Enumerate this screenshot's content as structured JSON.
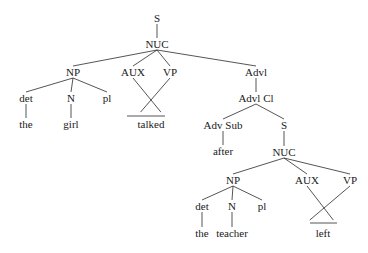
{
  "diagram": {
    "type": "syntax-tree",
    "nodes": [
      {
        "id": "S1",
        "label": "S",
        "x": 157,
        "y": 18
      },
      {
        "id": "NUC1",
        "label": "NUC",
        "x": 157,
        "y": 44
      },
      {
        "id": "NP1",
        "label": "NP",
        "x": 73,
        "y": 72
      },
      {
        "id": "AUX1",
        "label": "AUX",
        "x": 133,
        "y": 72
      },
      {
        "id": "VP1",
        "label": "VP",
        "x": 170,
        "y": 72
      },
      {
        "id": "det1",
        "label": "det",
        "x": 26,
        "y": 98
      },
      {
        "id": "N1",
        "label": "N",
        "x": 71,
        "y": 98
      },
      {
        "id": "pl1",
        "label": "pl",
        "x": 107,
        "y": 98
      },
      {
        "id": "the1",
        "label": "the",
        "x": 26,
        "y": 124
      },
      {
        "id": "girl",
        "label": "girl",
        "x": 71,
        "y": 124
      },
      {
        "id": "talked",
        "label": "talked",
        "x": 151,
        "y": 124
      },
      {
        "id": "Advl",
        "label": "Advl",
        "x": 256,
        "y": 72
      },
      {
        "id": "AdvlCl",
        "label": "Advl Cl",
        "x": 256,
        "y": 98
      },
      {
        "id": "AdvSub",
        "label": "Adv Sub",
        "x": 223,
        "y": 125
      },
      {
        "id": "S2",
        "label": "S",
        "x": 284,
        "y": 125
      },
      {
        "id": "after",
        "label": "after",
        "x": 223,
        "y": 151
      },
      {
        "id": "NUC2",
        "label": "NUC",
        "x": 284,
        "y": 152
      },
      {
        "id": "NP2",
        "label": "NP",
        "x": 233,
        "y": 180
      },
      {
        "id": "AUX2",
        "label": "AUX",
        "x": 307,
        "y": 180
      },
      {
        "id": "VP2",
        "label": "VP",
        "x": 350,
        "y": 180
      },
      {
        "id": "det2",
        "label": "det",
        "x": 202,
        "y": 206
      },
      {
        "id": "N2",
        "label": "N",
        "x": 232,
        "y": 206
      },
      {
        "id": "pl2",
        "label": "pl",
        "x": 262,
        "y": 206
      },
      {
        "id": "the2",
        "label": "the",
        "x": 202,
        "y": 233
      },
      {
        "id": "teacher",
        "label": "teacher",
        "x": 232,
        "y": 233
      },
      {
        "id": "left",
        "label": "left",
        "x": 323,
        "y": 233
      }
    ],
    "edges": [
      [
        "S1",
        "NUC1"
      ],
      [
        "NUC1",
        "NP1"
      ],
      [
        "NUC1",
        "AUX1"
      ],
      [
        "NUC1",
        "VP1"
      ],
      [
        "NUC1",
        "Advl"
      ],
      [
        "NP1",
        "det1"
      ],
      [
        "NP1",
        "N1"
      ],
      [
        "NP1",
        "pl1"
      ],
      [
        "det1",
        "the1"
      ],
      [
        "N1",
        "girl"
      ],
      [
        "Advl",
        "AdvlCl"
      ],
      [
        "AdvlCl",
        "AdvSub"
      ],
      [
        "AdvlCl",
        "S2"
      ],
      [
        "AdvSub",
        "after"
      ],
      [
        "S2",
        "NUC2"
      ],
      [
        "NUC2",
        "NP2"
      ],
      [
        "NUC2",
        "AUX2"
      ],
      [
        "NUC2",
        "VP2"
      ],
      [
        "NP2",
        "det2"
      ],
      [
        "NP2",
        "N2"
      ],
      [
        "NP2",
        "pl2"
      ],
      [
        "det2",
        "the2"
      ],
      [
        "N2",
        "teacher"
      ]
    ],
    "triangles": [
      {
        "from": [
          "AUX1",
          "VP1"
        ],
        "apex": [
          151,
          100
        ],
        "base": [
          [
            127,
            116
          ],
          [
            165,
            116
          ]
        ]
      },
      {
        "from": [
          "AUX2",
          "VP2"
        ],
        "apex": [
          324,
          208
        ],
        "base": [
          [
            310,
            223
          ],
          [
            337,
            223
          ]
        ]
      }
    ]
  }
}
